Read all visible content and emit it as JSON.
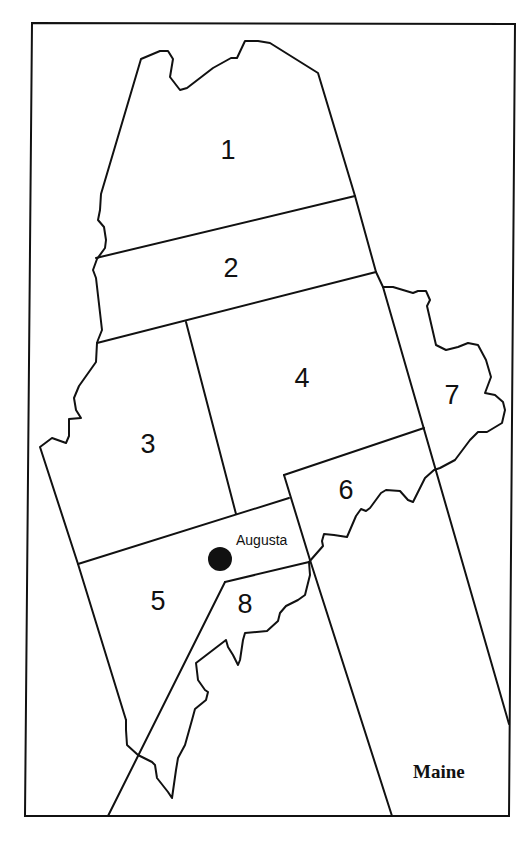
{
  "map": {
    "title": "Maine",
    "state": "Maine",
    "line_color": "#111111",
    "background": "#ffffff",
    "regions": [
      {
        "id": 1,
        "label": "1"
      },
      {
        "id": 2,
        "label": "2"
      },
      {
        "id": 3,
        "label": "3"
      },
      {
        "id": 4,
        "label": "4"
      },
      {
        "id": 5,
        "label": "5"
      },
      {
        "id": 6,
        "label": "6"
      },
      {
        "id": 7,
        "label": "7"
      },
      {
        "id": 8,
        "label": "8"
      }
    ],
    "capital": {
      "name": "Augusta",
      "marker": "filled-circle"
    }
  }
}
